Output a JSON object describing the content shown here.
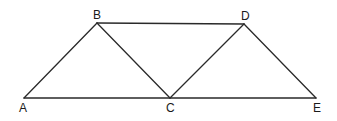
{
  "diagram": {
    "type": "geometry-figure",
    "stroke_color": "#2a2a2a",
    "points": [
      {
        "id": "A",
        "label": "A",
        "x": 24,
        "y": 98
      },
      {
        "id": "B",
        "label": "B",
        "x": 97,
        "y": 23
      },
      {
        "id": "C",
        "label": "C",
        "x": 170,
        "y": 98
      },
      {
        "id": "D",
        "label": "D",
        "x": 244,
        "y": 24
      },
      {
        "id": "E",
        "label": "E",
        "x": 316,
        "y": 98
      }
    ],
    "segments": [
      [
        "A",
        "B"
      ],
      [
        "B",
        "C"
      ],
      [
        "A",
        "C"
      ],
      [
        "C",
        "E"
      ],
      [
        "B",
        "D"
      ],
      [
        "C",
        "D"
      ],
      [
        "D",
        "E"
      ]
    ]
  }
}
